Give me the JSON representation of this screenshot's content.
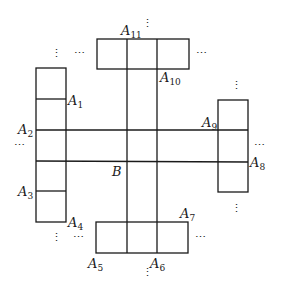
{
  "diagram": {
    "center_label": "B",
    "point_base": "A",
    "points": [
      {
        "id": "A1",
        "sub": "1"
      },
      {
        "id": "A2",
        "sub": "2"
      },
      {
        "id": "A3",
        "sub": "3"
      },
      {
        "id": "A4",
        "sub": "4"
      },
      {
        "id": "A5",
        "sub": "5"
      },
      {
        "id": "A6",
        "sub": "6"
      },
      {
        "id": "A7",
        "sub": "7"
      },
      {
        "id": "A8",
        "sub": "8"
      },
      {
        "id": "A9",
        "sub": "9"
      },
      {
        "id": "A10",
        "sub": "10"
      },
      {
        "id": "A11",
        "sub": "11"
      }
    ],
    "ellipsis_horizontal": "⋯",
    "ellipsis_vertical": "⋮"
  }
}
